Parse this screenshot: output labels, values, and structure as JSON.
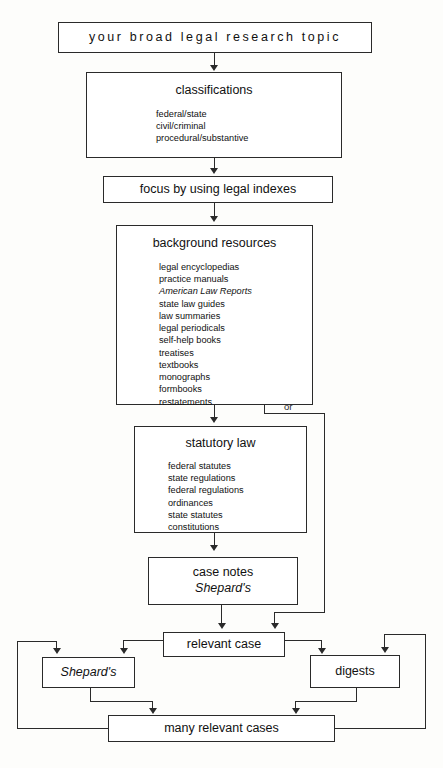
{
  "diagram": {
    "title": "your broad legal research topic",
    "or_label": "or",
    "nodes": {
      "topic": {
        "label": "your broad legal research topic"
      },
      "classifications": {
        "heading": "classifications",
        "items": [
          "federal/state",
          "civil/criminal",
          "procedural/substantive"
        ]
      },
      "focus": {
        "label": "focus by using legal indexes"
      },
      "background_resources": {
        "heading": "background resources",
        "items": [
          "legal encyclopedias",
          "practice manuals",
          "American Law Reports",
          "state law guides",
          "law summaries",
          "legal periodicals",
          "self-help books",
          "treatises",
          "textbooks",
          "monographs",
          "formbooks",
          "restatements"
        ],
        "italic_items": [
          "American Law Reports"
        ]
      },
      "statutory_law": {
        "heading": "statutory law",
        "items": [
          "federal statutes",
          "state regulations",
          "federal regulations",
          "ordinances",
          "state statutes",
          "constitutions"
        ]
      },
      "case_notes": {
        "line1": "case notes",
        "line2": "Shepard's"
      },
      "relevant_case": {
        "label": "relevant case"
      },
      "shepards": {
        "label": "Shepard's"
      },
      "digests": {
        "label": "digests"
      },
      "many_relevant_cases": {
        "label": "many relevant cases"
      }
    },
    "colors": {
      "stroke": "#2a2a2a",
      "background": "#fdfdfb",
      "box_fill": "#ffffff"
    }
  }
}
